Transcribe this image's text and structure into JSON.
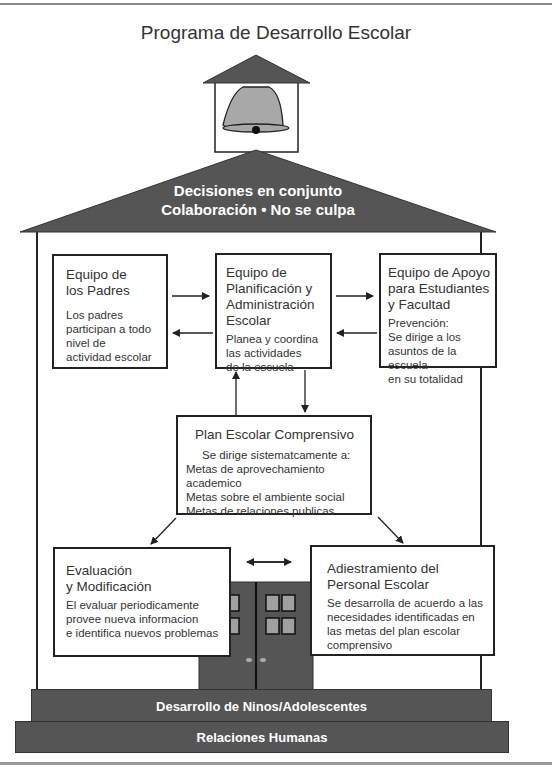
{
  "title": "Programa de Desarrollo Escolar",
  "roof": {
    "line1": "Decisiones en conjunto",
    "line2": "Colaboración • No se culpa"
  },
  "boxes": {
    "padres": {
      "heading": [
        "Equipo de",
        "los Padres"
      ],
      "body": [
        "Los padres",
        "participan a todo",
        "nivel de",
        "actividad escolar"
      ]
    },
    "planificacion": {
      "heading": [
        "Equipo de",
        "Planificación y",
        "Administración",
        "Escolar"
      ],
      "body": [
        "Planea y coordina",
        "las actividades",
        "de la escuela"
      ]
    },
    "apoyo": {
      "heading": [
        "Equipo de Apoyo",
        "para Estudiantes",
        "y Facultad"
      ],
      "body": [
        "Prevención:",
        "Se dirige a los",
        "asuntos de la escuela",
        "en su totalidad"
      ]
    },
    "plan": {
      "heading": "Plan Escolar Comprensivo",
      "intro": "Se dirige sistematcamente a:",
      "items": [
        "Metas de aprovechamiento academico",
        "Metas sobre el ambiente social",
        "Metas de relaciones publicas"
      ]
    },
    "evaluacion": {
      "heading": [
        "Evaluación",
        "y Modificación"
      ],
      "body": [
        "El evaluar periodicamente",
        "provee nueva informacion",
        "e identifica nuevos problemas"
      ]
    },
    "adiestramiento": {
      "heading": [
        "Adiestramiento del",
        "Personal Escolar"
      ],
      "body": [
        "Se desarrolla de acuerdo a las",
        "necesidades identificadas en",
        "las metas del plan escolar",
        "comprensivo"
      ]
    }
  },
  "steps": {
    "upper": "Desarrollo de Ninos/Adolescentes",
    "lower": "Relaciones Humanas"
  },
  "colors": {
    "roof": "#555555",
    "bell": "#a8a8a8",
    "door": "#555555",
    "window": "#a0a0a0",
    "outline": "#222222"
  }
}
